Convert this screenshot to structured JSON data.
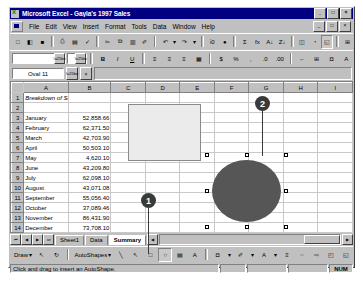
{
  "window": {
    "title": "Microsoft Excel - Gayla's 1997 Sales",
    "minimize": "_",
    "maximize": "□",
    "close": "×",
    "doc_minimize": "_",
    "doc_restore": "□",
    "doc_close": "×"
  },
  "menu": {
    "items": [
      {
        "label": "File"
      },
      {
        "label": "Edit"
      },
      {
        "label": "View"
      },
      {
        "label": "Insert"
      },
      {
        "label": "Format"
      },
      {
        "label": "Tools"
      },
      {
        "label": "Data"
      },
      {
        "label": "Window"
      },
      {
        "label": "Help"
      }
    ]
  },
  "standard_toolbar": {
    "buttons": [
      {
        "name": "new-icon",
        "glyph": "□"
      },
      {
        "name": "open-icon",
        "glyph": "◧"
      },
      {
        "name": "save-icon",
        "glyph": "■"
      },
      {
        "name": "print-icon",
        "glyph": "⎙"
      },
      {
        "name": "print-preview-icon",
        "glyph": "▤"
      },
      {
        "name": "spelling-icon",
        "glyph": "✓"
      },
      {
        "name": "cut-icon",
        "glyph": "✂"
      },
      {
        "name": "copy-icon",
        "glyph": "⧉"
      },
      {
        "name": "paste-icon",
        "glyph": "▥"
      },
      {
        "name": "format-painter-icon",
        "glyph": "✐"
      },
      {
        "name": "undo-icon",
        "glyph": "↶"
      },
      {
        "name": "undo-dropdown-icon",
        "glyph": "▾"
      },
      {
        "name": "redo-icon",
        "glyph": "↷"
      },
      {
        "name": "redo-dropdown-icon",
        "glyph": "▾"
      },
      {
        "name": "insert-hyperlink-icon",
        "glyph": "ἱ0"
      },
      {
        "name": "web-toolbar-icon",
        "glyph": "●"
      },
      {
        "name": "autosum-icon",
        "glyph": "Σ"
      },
      {
        "name": "paste-function-icon",
        "glyph": "fx"
      },
      {
        "name": "sort-ascending-icon",
        "glyph": "A↓"
      },
      {
        "name": "sort-descending-icon",
        "glyph": "Z↓"
      },
      {
        "name": "chart-wizard-icon",
        "glyph": "◫"
      },
      {
        "name": "map-icon",
        "glyph": "◔"
      },
      {
        "name": "drawing-icon",
        "glyph": "◱"
      },
      {
        "name": "zoom-icon",
        "glyph": "⊞"
      }
    ]
  },
  "formatting_toolbar": {
    "font_value": "",
    "size_value": "",
    "buttons": [
      {
        "name": "bold-icon",
        "glyph": "B"
      },
      {
        "name": "italic-icon",
        "glyph": "I"
      },
      {
        "name": "underline-icon",
        "glyph": "U"
      },
      {
        "name": "align-left-icon",
        "glyph": "≡"
      },
      {
        "name": "align-center-icon",
        "glyph": "≡"
      },
      {
        "name": "align-right-icon",
        "glyph": "≡"
      },
      {
        "name": "merge-center-icon",
        "glyph": "▦"
      },
      {
        "name": "currency-icon",
        "glyph": "$"
      },
      {
        "name": "percent-icon",
        "glyph": "%"
      },
      {
        "name": "comma-icon",
        "glyph": ","
      },
      {
        "name": "increase-decimal-icon",
        "glyph": ".0"
      },
      {
        "name": "decrease-decimal-icon",
        "glyph": ".00"
      },
      {
        "name": "decrease-indent-icon",
        "glyph": "←"
      },
      {
        "name": "borders-icon",
        "glyph": "⊞"
      },
      {
        "name": "fill-color-icon",
        "glyph": "◘"
      },
      {
        "name": "font-color-icon",
        "glyph": "A"
      }
    ]
  },
  "formula_bar": {
    "name_box_value": "Oval 11",
    "cancel_label": "×",
    "enter_label": "✓",
    "function_label": "=",
    "formula_value": ""
  },
  "grid": {
    "columns": [
      "A",
      "B",
      "C",
      "D",
      "E",
      "F",
      "G",
      "H",
      "I"
    ],
    "rows": [
      {
        "num": "1",
        "a": "Breakdown of Sales",
        "b": "",
        "title": true
      },
      {
        "num": "2",
        "a": "",
        "b": ""
      },
      {
        "num": "3",
        "a": "January",
        "b": "52,858.66"
      },
      {
        "num": "4",
        "a": "February",
        "b": "62,371.50"
      },
      {
        "num": "5",
        "a": "March",
        "b": "42,703.90"
      },
      {
        "num": "6",
        "a": "April",
        "b": "50,503.10"
      },
      {
        "num": "7",
        "a": "May",
        "b": "4,620.10"
      },
      {
        "num": "8",
        "a": "June",
        "b": "43,209.80"
      },
      {
        "num": "9",
        "a": "July",
        "b": "62,098.10"
      },
      {
        "num": "10",
        "a": "August",
        "b": "43,071.08"
      },
      {
        "num": "11",
        "a": "September",
        "b": "55,056.40"
      },
      {
        "num": "12",
        "a": "October",
        "b": "37,089.46"
      },
      {
        "num": "13",
        "a": "November",
        "b": "86,431.90"
      },
      {
        "num": "14",
        "a": "December",
        "b": "73,708.10"
      },
      {
        "num": "15",
        "a": "",
        "b": ""
      },
      {
        "num": "16",
        "a": "",
        "b": ""
      }
    ]
  },
  "shapes": {
    "rectangle_name": "rectangle-shape",
    "oval_name": "oval-shape",
    "oval_fill": "#565656",
    "rectangle_fill": "#ebebeb"
  },
  "callouts": [
    {
      "label": "1"
    },
    {
      "label": "2"
    }
  ],
  "sheet_tabs": {
    "nav_first": "⏮",
    "nav_prev": "◀",
    "nav_next": "▶",
    "nav_last": "⏭",
    "tabs": [
      {
        "label": "Sheet1",
        "active": false
      },
      {
        "label": "Data",
        "active": false
      },
      {
        "label": "Summary",
        "active": true
      }
    ],
    "scroll_left": "◀",
    "scroll_right": "▶"
  },
  "drawing_toolbar": {
    "draw_label": "Draw",
    "draw_arrow": "▾",
    "autoshapes_label": "AutoShapes",
    "autoshapes_arrow": "▾",
    "buttons": [
      {
        "name": "select-objects-icon",
        "glyph": "↖",
        "pressed": false
      },
      {
        "name": "free-rotate-icon",
        "glyph": "↻",
        "pressed": false
      },
      {
        "name": "line-icon",
        "glyph": "╲",
        "pressed": false
      },
      {
        "name": "arrow-icon",
        "glyph": "↖",
        "pressed": false
      },
      {
        "name": "rectangle-icon",
        "glyph": "□",
        "pressed": false
      },
      {
        "name": "oval-icon",
        "glyph": "○",
        "pressed": true
      },
      {
        "name": "text-box-icon",
        "glyph": "▤",
        "pressed": false
      },
      {
        "name": "insert-wordart-icon",
        "glyph": "A",
        "pressed": false
      },
      {
        "name": "fill-color-icon",
        "glyph": "◘",
        "pressed": false
      },
      {
        "name": "fill-color-arrow-icon",
        "glyph": "▾",
        "pressed": false
      },
      {
        "name": "line-color-icon",
        "glyph": "✐",
        "pressed": false
      },
      {
        "name": "line-color-arrow-icon",
        "glyph": "▾",
        "pressed": false
      },
      {
        "name": "font-color-icon",
        "glyph": "A",
        "pressed": false
      },
      {
        "name": "font-color-arrow-icon",
        "glyph": "▾",
        "pressed": false
      },
      {
        "name": "line-style-icon",
        "glyph": "≡",
        "pressed": false
      },
      {
        "name": "dash-style-icon",
        "glyph": "┈",
        "pressed": false
      },
      {
        "name": "arrow-style-icon",
        "glyph": "⇨",
        "pressed": false
      },
      {
        "name": "shadow-icon",
        "glyph": "◰",
        "pressed": false
      },
      {
        "name": "3d-icon",
        "glyph": "◱",
        "pressed": false
      }
    ]
  },
  "status_bar": {
    "message": "Click and drag to insert an AutoShape.",
    "pane1": "",
    "pane2": "",
    "pane3": "",
    "num_lock": "NUM"
  }
}
